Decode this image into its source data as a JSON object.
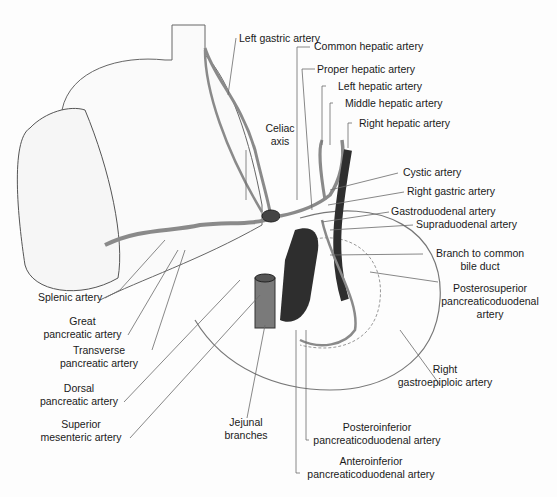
{
  "figure": {
    "type": "anatomical illustration"
  },
  "labels": {
    "left_gastric_artery": "Left gastric artery",
    "common_hepatic_artery": "Common hepatic artery",
    "proper_hepatic_artery": "Proper hepatic artery",
    "left_hepatic_artery": "Left hepatic artery",
    "middle_hepatic_artery": "Middle hepatic artery",
    "right_hepatic_artery": "Right hepatic artery",
    "celiac_axis": [
      "Celiac",
      "axis"
    ],
    "cystic_artery": "Cystic artery",
    "right_gastric_artery": "Right gastric artery",
    "gastroduodenal_artery": "Gastroduodenal artery",
    "supraduodenal_artery": "Supraduodenal artery",
    "branch_to_common_bile_duct": [
      "Branch to common",
      "bile duct"
    ],
    "posterosuperior_pd_artery": [
      "Posterosuperior",
      "pancreaticoduodenal",
      "artery"
    ],
    "splenic_artery": "Splenic artery",
    "great_pancreatic_artery": [
      "Great",
      "pancreatic artery"
    ],
    "transverse_pancreatic_artery": [
      "Transverse",
      "pancreatic artery"
    ],
    "dorsal_pancreatic_artery": [
      "Dorsal",
      "pancreatic artery"
    ],
    "superior_mesenteric_artery": [
      "Superior",
      "mesenteric artery"
    ],
    "jejunal_branches": [
      "Jejunal",
      "branches"
    ],
    "right_gastroepiploic_artery": [
      "Right",
      "gastroepiploic artery"
    ],
    "posteroinferior_pd_artery": [
      "Posteroinferior",
      "pancreaticoduodenal artery"
    ],
    "anteroinferior_pd_artery": [
      "Anteroinferior",
      "pancreaticoduodenal artery"
    ]
  },
  "colors": {
    "background": "#fdfdfd",
    "outline": "#555555",
    "artery": "#8a8a8a",
    "vessel_dark": "#2e2e2e",
    "leader_line": "#6a6a6a",
    "text": "#1a1a1a"
  }
}
